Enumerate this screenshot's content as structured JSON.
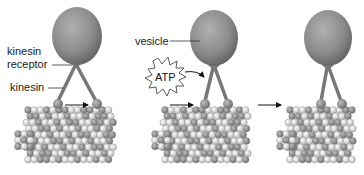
{
  "diagram": {
    "labels": {
      "kinesin_receptor_line1": "kinesin",
      "kinesin_receptor_line2": "receptor",
      "kinesin": "kinesin",
      "vesicle": "vesicle",
      "atp": "ATP"
    },
    "panels": [
      {
        "id": "step-1",
        "description": "Kinesin bound to microtubule; rear head about to step forward"
      },
      {
        "id": "step-2",
        "description": "ATP binds; rear head swings forward"
      },
      {
        "id": "step-3",
        "description": "Kinesin and vesicle advanced one step along microtubule"
      }
    ],
    "colors": {
      "vesicle": "#8a8a8a",
      "vesicle_highlight": "#b5b5b5",
      "kinesin": "#7a7a7a",
      "tubulin_dark": "#8c8c8c",
      "tubulin_light": "#e6e6e6",
      "arrow": "#111111",
      "background": "#ffffff"
    }
  }
}
